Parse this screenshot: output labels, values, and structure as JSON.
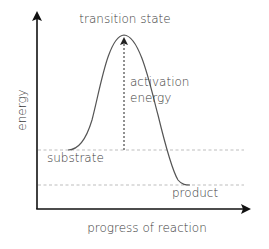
{
  "diagram": {
    "type": "energy-profile",
    "labels": {
      "peak": "transition state",
      "activation_line1": "activation",
      "activation_line2": "energy",
      "start": "substrate",
      "end": "product",
      "y_axis": "energy",
      "x_axis": "progress of reaction"
    },
    "colors": {
      "axis": "#111111",
      "curve": "#555555",
      "dashed_guide": "#bdbdbd",
      "activation_arrow": "#222222",
      "text": "#3a3a3a"
    },
    "levels": {
      "substrate_y": 150,
      "product_y": 185,
      "peak_y": 35
    }
  }
}
